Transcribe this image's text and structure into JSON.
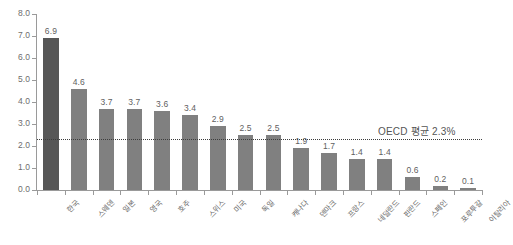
{
  "chart_data": {
    "type": "bar",
    "title": "",
    "subtitle": "",
    "xlabel": "",
    "ylabel": "",
    "ylim": [
      0.0,
      8.0
    ],
    "ytick_step": 1.0,
    "yticks": [
      "8.0",
      "7.0",
      "6.0",
      "5.0",
      "4.0",
      "3.0",
      "2.0",
      "1.0",
      "0.0"
    ],
    "grid": false,
    "legend": "none",
    "categories": [
      "한국",
      "스웨덴",
      "일본",
      "영국",
      "호주",
      "스위스",
      "미국",
      "독일",
      "캐나다",
      "덴마크",
      "프랑스",
      "네덜란드",
      "핀란드",
      "스페인",
      "포루투갈",
      "이탈리아"
    ],
    "values": [
      6.9,
      4.6,
      3.7,
      3.7,
      3.6,
      3.4,
      2.9,
      2.5,
      2.5,
      1.9,
      1.7,
      1.4,
      1.4,
      0.6,
      0.2,
      0.1
    ],
    "value_labels": [
      "6.9",
      "4.6",
      "3.7",
      "3.7",
      "3.6",
      "3.4",
      "2.9",
      "2.5",
      "2.5",
      "1.9",
      "1.7",
      "1.4",
      "1.4",
      "0.6",
      "0.2",
      "0.1"
    ],
    "highlight_index": 0,
    "bar_color": "#808080",
    "highlight_color": "#575757",
    "reference_line": {
      "value": 2.3,
      "label": "OECD 평균 2.3%",
      "style": "dotted",
      "color": "#3d3d3d"
    },
    "axis_color": "#9a9a9a",
    "text_color": "#6a6a6a"
  }
}
